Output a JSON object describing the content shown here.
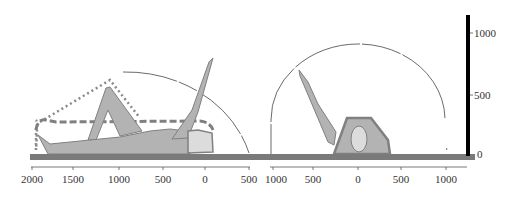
{
  "figure": {
    "type": "reach-envelope-diagram"
  },
  "colors": {
    "body_fill": "#b3b3b3",
    "body_outline": "#808080",
    "head_fill": "#dcdcdc",
    "floor": "#7a7a7a",
    "envelope_line": "#444444",
    "dotted_line": "#8a8a8a",
    "dashed_line": "#808080",
    "scale_bar": "#000000",
    "axis": "#555555"
  },
  "left_view": {
    "name": "side-view",
    "x_axis": {
      "ticks": [
        {
          "value": "2000",
          "x": 32
        },
        {
          "value": "1500",
          "x": 73
        },
        {
          "value": "1000",
          "x": 119
        },
        {
          "value": "500",
          "x": 163
        },
        {
          "value": "0",
          "x": 205
        },
        {
          "value": "500",
          "x": 249
        }
      ]
    }
  },
  "right_view": {
    "name": "front-view",
    "x_axis": {
      "ticks": [
        {
          "value": "1000",
          "x": 273
        },
        {
          "value": "500",
          "x": 313
        },
        {
          "value": "0",
          "x": 358
        },
        {
          "value": "500",
          "x": 401
        },
        {
          "value": "1000",
          "x": 446
        }
      ]
    }
  },
  "vertical_scale": {
    "ticks": [
      {
        "value": "1000",
        "y": 33
      },
      {
        "value": "500",
        "y": 95
      },
      {
        "value": "0",
        "y": 155
      }
    ]
  }
}
